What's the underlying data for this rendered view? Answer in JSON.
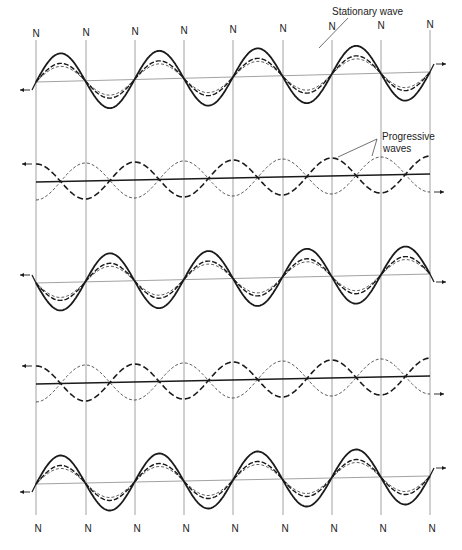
{
  "figure": {
    "node_label": "N",
    "node_x": [
      36,
      86,
      135,
      184,
      233,
      283,
      332,
      381,
      430
    ],
    "labels": {
      "stationary": "Stationary wave",
      "progressive_line1": "Progressive",
      "progressive_line2": "waves"
    },
    "rows": [
      {
        "id": "row1",
        "type": "stationary",
        "y0": 82,
        "y1": 72,
        "phase": 1,
        "amp_solid": 28,
        "amp_dash": 18,
        "amp_thin": 15,
        "arrow_left": true,
        "arrow_right": true
      },
      {
        "id": "row2",
        "type": "progressive",
        "y0": 182,
        "y1": 174,
        "amp": 18,
        "arrow_left": true,
        "arrow_right": true
      },
      {
        "id": "row3",
        "type": "stationary",
        "y0": 283,
        "y1": 274,
        "phase": -1,
        "amp_solid": 28,
        "amp_dash": 18,
        "amp_thin": 15,
        "arrow_left": true,
        "arrow_right": true
      },
      {
        "id": "row4",
        "type": "progressive",
        "y0": 384,
        "y1": 376,
        "amp": 18,
        "arrow_left": true,
        "arrow_right": true
      },
      {
        "id": "row5",
        "type": "stationary",
        "y0": 484,
        "y1": 476,
        "phase": 1,
        "amp_solid": 28,
        "amp_dash": 18,
        "amp_thin": 15,
        "arrow_left": true,
        "arrow_right": true
      }
    ],
    "colors": {
      "ink": "#1a1a1a",
      "grid": "#8a8a8a"
    }
  }
}
